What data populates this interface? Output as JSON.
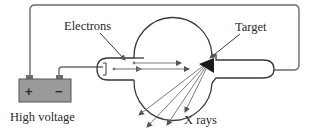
{
  "diagram": {
    "labels": {
      "electrons": "Electrons",
      "target": "Target",
      "xrays": "X rays",
      "power": "High voltage",
      "plus": "+",
      "minus": "−"
    },
    "colors": {
      "wire": "#6b6b6b",
      "tube_outline": "#3a3a3a",
      "battery_fill": "#9a9a9a",
      "battery_stroke": "#555555",
      "terminal_fill": "#6e6e6e",
      "target_fill": "#1a1a1a",
      "ray": "#7a7a7a",
      "text": "#2a2a2a"
    }
  }
}
